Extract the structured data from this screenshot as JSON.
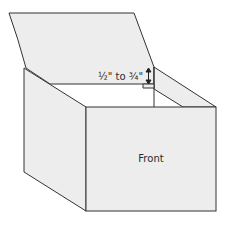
{
  "diagram": {
    "labels": {
      "front": "Front",
      "measurement": "½\" to ¾\""
    },
    "colors": {
      "panel_fill": "#ededed",
      "stroke": "#333333",
      "background": "#ffffff"
    }
  }
}
